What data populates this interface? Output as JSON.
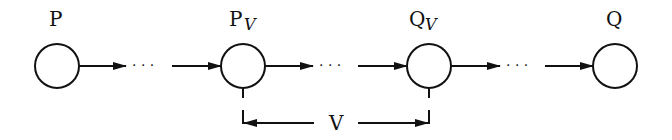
{
  "diagram": {
    "nodes": [
      {
        "id": "P",
        "label": "P",
        "subscript": ""
      },
      {
        "id": "Pv",
        "label": "P",
        "subscript": "V"
      },
      {
        "id": "Qv",
        "label": "Q",
        "subscript": "V"
      },
      {
        "id": "Q",
        "label": "Q",
        "subscript": ""
      }
    ],
    "ellipsis": "· · ·",
    "span_label": "V"
  }
}
